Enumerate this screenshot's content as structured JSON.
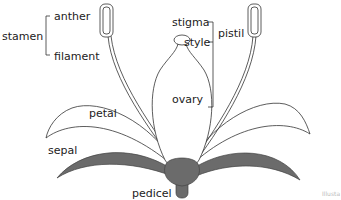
{
  "diagram": {
    "labels": {
      "stamen": "stamen",
      "anther": "anther",
      "filament": "filament",
      "stigma": "stigma",
      "style": "style",
      "pistil": "pistil",
      "ovary": "ovary",
      "petal": "petal",
      "sepal": "sepal",
      "pedicel": "pedicel"
    },
    "credit": "Illusta",
    "colors": {
      "outline": "#333333",
      "sepal_fill": "#6b6b6b",
      "receptacle_fill": "#6b6b6b",
      "background": "#ffffff"
    }
  }
}
